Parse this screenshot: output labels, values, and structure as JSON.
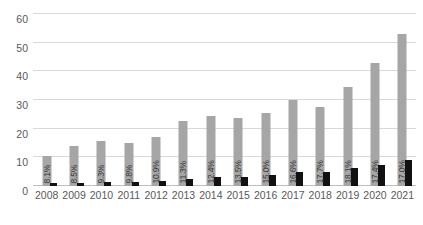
{
  "chart_data": {
    "type": "bar",
    "title": "",
    "subtitle": "",
    "xlabel": "",
    "ylabel": "",
    "ylim": [
      0,
      60
    ],
    "yticks": [
      0,
      10,
      20,
      30,
      40,
      50,
      60
    ],
    "grid": true,
    "legend": "none",
    "categories": [
      "2008",
      "2009",
      "2010",
      "2011",
      "2012",
      "2013",
      "2014",
      "2015",
      "2016",
      "2017",
      "2018",
      "2019",
      "2020",
      "2021"
    ],
    "series": [
      {
        "name": "Total",
        "color": "#a6a6a6",
        "values": [
          10.5,
          14.0,
          15.6,
          15.1,
          17.0,
          22.6,
          24.3,
          23.6,
          25.4,
          30.1,
          27.4,
          34.4,
          42.8,
          53.0
        ]
      },
      {
        "name": "Subset",
        "color": "#111111",
        "values": [
          0.9,
          1.2,
          1.5,
          1.5,
          1.9,
          2.6,
          3.0,
          3.2,
          3.8,
          5.0,
          4.9,
          6.2,
          7.4,
          9.0
        ]
      }
    ],
    "point_labels": [
      "8.1%",
      "8.5%",
      "9.3%",
      "9.8%",
      "10.9%",
      "11.3%",
      "12.4%",
      "13.5%",
      "15.0%",
      "16.6%",
      "17.7%",
      "18.1%",
      "17.4%",
      "17.0%"
    ],
    "colors": {
      "gray_bar": "#a6a6a6",
      "black_bar": "#111111",
      "gridline": "#d9d9d9",
      "baseline": "#bfbfbf",
      "axis_text": "#595959",
      "label_text": "#3a3a3a",
      "background": "#ffffff"
    }
  }
}
